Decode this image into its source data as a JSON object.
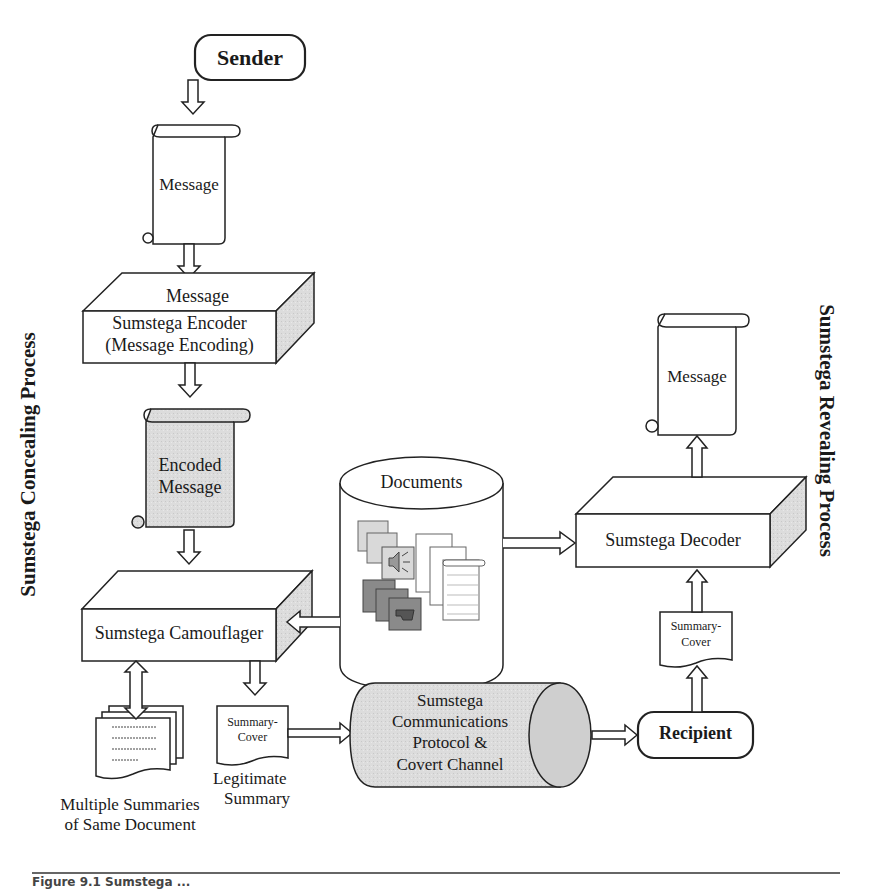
{
  "sender": {
    "label": "Sender"
  },
  "message_top": {
    "label": "Message"
  },
  "encoder": {
    "top_label": "Message",
    "line1": "Sumstega Encoder",
    "line2": "(Message Encoding)"
  },
  "encoded_message": {
    "line1": "Encoded",
    "line2": "Message"
  },
  "camouflager": {
    "label": "Sumstega Camouflager"
  },
  "documents": {
    "label": "Documents"
  },
  "multiple_summaries": {
    "line1": "Multiple Summaries",
    "line2": "of Same Document"
  },
  "summary_cover_left": {
    "line1": "Summary-",
    "line2": "Cover"
  },
  "legitimate_summary": {
    "line1": "Legitimate",
    "line2": "Summary"
  },
  "channel": {
    "line1": "Sumstega",
    "line2": "Communications",
    "line3": "Protocol &",
    "line4": "Covert Channel"
  },
  "recipient": {
    "label": "Recipient"
  },
  "summary_cover_right": {
    "line1": "Summary-",
    "line2": "Cover"
  },
  "decoder": {
    "label": "Sumstega Decoder"
  },
  "message_right": {
    "label": "Message"
  },
  "side_labels": {
    "left": "Sumstega Concealing Process",
    "right": "Sumstega Revealing Process"
  },
  "caption": {
    "text": "Figure 9.1  Sumstega ..."
  },
  "colors": {
    "shade": "#d9d9d9",
    "stroke": "#222222",
    "dark_icon": "#8a8a8a"
  }
}
